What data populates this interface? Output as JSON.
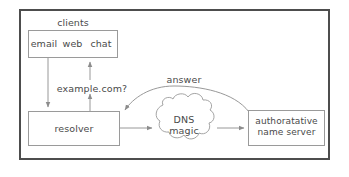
{
  "diagram": {
    "frame": {
      "border_color": "#4d4d4d"
    },
    "palette": {
      "box_stroke": "#9a9a9a",
      "arrow_stroke": "#8c8c8c",
      "text": "#4a4a4a",
      "background": "#ffffff"
    },
    "nodes": {
      "clients": {
        "caption": "clients",
        "segments": [
          {
            "label": "email"
          },
          {
            "label": "web"
          },
          {
            "label": "chat"
          }
        ]
      },
      "resolver": {
        "label": "resolver"
      },
      "dns_magic": {
        "line1": "DNS",
        "line2": "magic",
        "shape": "cloud"
      },
      "authoritative": {
        "line1": "authoratative",
        "line2": "name server"
      }
    },
    "edges": [
      {
        "id": "clients-to-resolver",
        "label": "",
        "from": "clients",
        "to": "resolver",
        "direction": "down"
      },
      {
        "id": "query",
        "label": "example.com?",
        "from": "resolver",
        "to": "clients",
        "direction": "up"
      },
      {
        "id": "resolver-to-cloud",
        "label": "",
        "from": "resolver",
        "to": "dns_magic",
        "direction": "right"
      },
      {
        "id": "cloud-to-auth",
        "label": "",
        "from": "dns_magic",
        "to": "authoritative",
        "direction": "right"
      },
      {
        "id": "answer",
        "label": "answer",
        "from": "authoritative",
        "to": "resolver",
        "direction": "curved-left"
      }
    ]
  }
}
